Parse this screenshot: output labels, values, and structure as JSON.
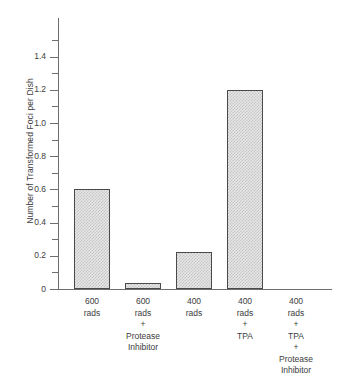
{
  "chart_data": {
    "type": "bar",
    "title": "",
    "xlabel": "",
    "ylabel": "Number of Transformed Foci per Dish",
    "ylim": [
      0,
      1.5
    ],
    "grid": false,
    "legend": "none",
    "categories": [
      "600 rads",
      "600 rads + Protease Inhibitor",
      "400 rads",
      "400 rads + TPA",
      "400 rads + TPA + Protease Inhibitor"
    ],
    "category_lines": [
      [
        "600",
        "rads"
      ],
      [
        "600",
        "rads",
        "+",
        "Protease",
        "Inhibitor"
      ],
      [
        "400",
        "rads"
      ],
      [
        "400",
        "rads",
        "+",
        "TPA"
      ],
      [
        "400",
        "rads",
        "+",
        "TPA",
        "+",
        "Protease",
        "Inhibitor"
      ]
    ],
    "values": [
      0.6,
      0.035,
      0.22,
      1.2,
      0
    ],
    "ytick_labels": [
      "0",
      "0.2",
      "0.4",
      "0.6",
      "0.8",
      "1.0",
      "1.2",
      "1.4"
    ],
    "ytick_values": [
      0,
      0.2,
      0.4,
      0.6,
      0.8,
      1.0,
      1.2,
      1.4
    ],
    "minor_tick_values": [
      0.1,
      0.3,
      0.5,
      0.7,
      0.9,
      1.1,
      1.3,
      1.5
    ],
    "bar_fill_color": "#e7e7e7",
    "bar_pattern_color": "#c4c4c4",
    "bar_border_color": "#4a4a4a",
    "axis_color": "#6e6e6e",
    "text_color": "#3d3d3d",
    "background_color": "#ffffff"
  }
}
